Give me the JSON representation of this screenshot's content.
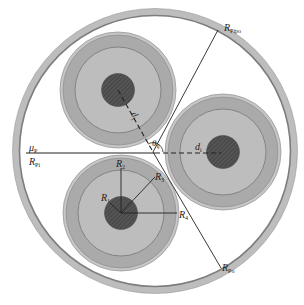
{
  "diagram": {
    "labels": {
      "mu_p": "μ",
      "mu_p_sub": "P",
      "r_pi": "R",
      "r_pi_sub": "Pi",
      "r_pipo_top": "R",
      "r_pipo_top_sub": "Pipo",
      "r_po_bottom": "R",
      "r_po_bottom_sub": "Po",
      "theta": "θ",
      "theta_sub": "ij",
      "d_i": "d",
      "d_i_sub": "i",
      "d_j": "d",
      "d_j_sub": "j",
      "r1": "R",
      "r1_sub": "1",
      "r2": "R",
      "r2_sub": "2",
      "r3": "R",
      "r3_sub": "3",
      "r4": "R",
      "r4_sub": "4"
    },
    "colors": {
      "pipe_outer": "#b8b8b8",
      "pipe_inner_band": "#8a8a8a",
      "cable_outer_sheath": "#bdbdbd",
      "cable_insulation_band": "#a9a9a9",
      "cable_inner": "#bcbcbc",
      "core": "#505050",
      "line": "#222222"
    }
  }
}
